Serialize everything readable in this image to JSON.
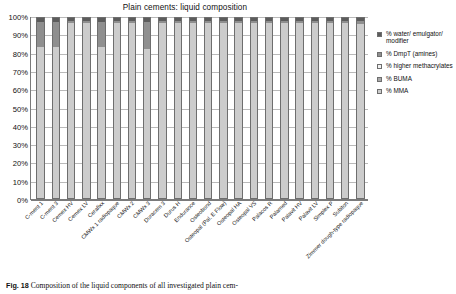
{
  "figure": {
    "caption_number": "Fig. 18",
    "caption_text": "Composition of the liquid components of all investigated plain cem-"
  },
  "chart_data": {
    "type": "bar",
    "stacked": true,
    "stack_mode": "percent",
    "title": "Plain cements: liquid composition",
    "xlabel": "",
    "ylabel": "",
    "ylim": [
      0,
      100
    ],
    "ytick_labels": [
      "100%",
      "90%",
      "80%",
      "70%",
      "60%",
      "50%",
      "40%",
      "30%",
      "20%",
      "10%",
      "0%"
    ],
    "ytick_values": [
      100,
      90,
      80,
      70,
      60,
      50,
      40,
      30,
      20,
      10,
      0
    ],
    "grid": true,
    "legend_position": "right",
    "categories": [
      "C-ment 1",
      "C-ment 3",
      "Cemex HV",
      "Cemex LV",
      "Cerafixx",
      "CMWx 1 radiopaque",
      "CMWx 2",
      "CMWx 3",
      "Duracem 3",
      "Durus H",
      "Endurance",
      "Osteobond",
      "Osteopal (Pal. E Flow)",
      "Osteopal HA",
      "Osteopal VS",
      "Palacos R",
      "Palamed",
      "Palavit HV",
      "Palavit LV",
      "Simplex P",
      "Subiton",
      "Zimmer dough-type radiopaque"
    ],
    "series": [
      {
        "name": "% MMA",
        "color": "#cccccc",
        "values": [
          84,
          84,
          97,
          97,
          84,
          97.5,
          97.5,
          83,
          97.5,
          97.5,
          97.5,
          97.5,
          97.5,
          97.5,
          97.5,
          97.5,
          97,
          97.5,
          97.5,
          97.5,
          97.5,
          96.5
        ]
      },
      {
        "name": "% BUMA",
        "color": "#a8a8a8",
        "values": [
          0,
          0,
          0,
          0,
          0,
          0,
          0,
          0,
          0,
          0,
          0,
          0,
          0,
          0,
          0,
          0,
          0,
          0,
          0,
          0,
          0,
          0
        ]
      },
      {
        "name": "% higher methacrylates",
        "color": "#f2f2f2",
        "values": [
          0,
          0,
          0,
          0,
          0,
          0,
          0,
          0,
          0,
          0,
          0,
          0,
          0,
          0,
          0,
          0,
          0,
          0,
          0,
          0,
          0,
          0
        ]
      },
      {
        "name": "% DmpT (amines)",
        "color": "#8f8f8f",
        "values": [
          14,
          14,
          1.5,
          1.5,
          14,
          1,
          1,
          15,
          1,
          1,
          1,
          1,
          1,
          1,
          1,
          1,
          1.5,
          1,
          1,
          1,
          1,
          2
        ]
      },
      {
        "name": "% water/emulgator/modifier",
        "color": "#5c5c5c",
        "values": [
          2,
          2,
          1.5,
          1.5,
          2,
          1.5,
          1.5,
          2,
          1.5,
          1.5,
          1.5,
          1.5,
          1.5,
          1.5,
          1.5,
          1.5,
          1.5,
          1.5,
          1.5,
          1.5,
          1.5,
          1.5
        ]
      }
    ],
    "legend": [
      {
        "label": "% water/ emulgator/ modifier",
        "color": "#5c5c5c"
      },
      {
        "label": "% DmpT (amines)",
        "color": "#8f8f8f"
      },
      {
        "label": "% higher methacrylates",
        "color": "#f2f2f2"
      },
      {
        "label": "% BUMA",
        "color": "#a8a8a8"
      },
      {
        "label": "% MMA",
        "color": "#cccccc"
      }
    ]
  }
}
